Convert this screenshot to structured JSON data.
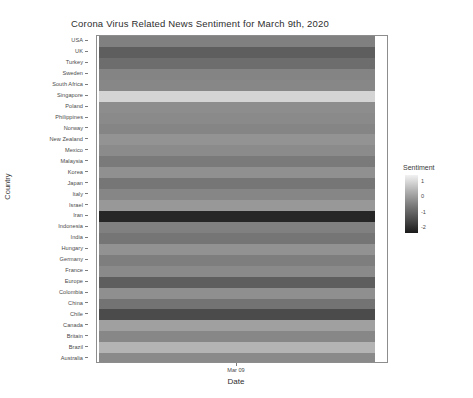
{
  "chart_data": {
    "type": "heatmap",
    "title": "Corona Virus Related News Sentiment for March 9th, 2020",
    "xlabel": "Date",
    "ylabel": "Country",
    "x_tick_labels": [
      "Mar 09"
    ],
    "legend": {
      "title": "Sentiment",
      "position": "right",
      "colormap": "grayscale",
      "ticks": [
        "1",
        "0",
        "-1",
        "-2"
      ],
      "tick_values": [
        1,
        0,
        -1,
        -2
      ],
      "vmin": -2.4,
      "vmax": 1.4,
      "low_color": "#1a1a1a",
      "high_color": "#f2f2f2"
    },
    "grid": false,
    "categories": [
      "USA",
      "UK",
      "Turkey",
      "Sweden",
      "South Africa",
      "Singapore",
      "Poland",
      "Philippines",
      "Norway",
      "New Zealand",
      "Mexico",
      "Malaysia",
      "Korea",
      "Japan",
      "Italy",
      "Israel",
      "Iran",
      "Indonesia",
      "India",
      "Hungary",
      "Germany",
      "France",
      "Europe",
      "Colombia",
      "China",
      "Chile",
      "Canada",
      "Britain",
      "Brazil",
      "Australia"
    ],
    "values": [
      -0.45,
      -0.95,
      -0.7,
      -0.4,
      -0.35,
      0.95,
      -0.25,
      -0.3,
      -0.38,
      -0.15,
      -0.28,
      -0.55,
      -0.2,
      -0.6,
      -0.32,
      -0.05,
      -2.1,
      -0.45,
      -0.62,
      -0.18,
      -0.48,
      -0.3,
      -0.95,
      -0.22,
      -0.65,
      -1.25,
      0.2,
      -0.35,
      0.45,
      -0.3
    ],
    "cell_colors": [
      "#808080",
      "#5e5e5e",
      "#6d6d6d",
      "#848484",
      "#878787",
      "#d4d4d4",
      "#8d8d8d",
      "#8a8a8a",
      "#858585",
      "#939393",
      "#8b8b8b",
      "#7a7a7a",
      "#909090",
      "#767676",
      "#868686",
      "#989898",
      "#262626",
      "#808080",
      "#757575",
      "#929292",
      "#7e7e7e",
      "#8a8a8a",
      "#5e5e5e",
      "#8f8f8f",
      "#737373",
      "#4b4b4b",
      "#a0a0a0",
      "#878787",
      "#b4b4b4",
      "#8a8a8a"
    ]
  }
}
